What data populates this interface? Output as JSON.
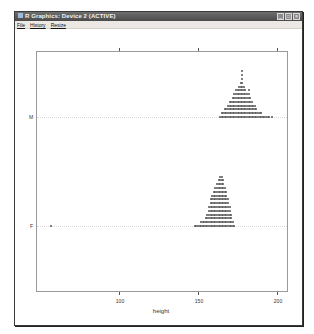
{
  "window": {
    "title": "R Graphics: Device 2 (ACTIVE)",
    "menu": [
      "File",
      "History",
      "Resize"
    ],
    "buttons": {
      "minimize": "_",
      "maximize": "□",
      "close": "×"
    }
  },
  "chart_data": {
    "type": "scatter",
    "subtype": "stripplot (stacked dots)",
    "title": "",
    "xlabel": "height",
    "ylabel": "",
    "categories": [
      "F",
      "M"
    ],
    "x_ticks": [
      100,
      150,
      200
    ],
    "xlim": [
      48,
      206
    ],
    "grid": "dotted horizontal reference lines at each category",
    "series": [
      {
        "name": "M",
        "value_range": [
          164,
          195
        ],
        "outliers": [
          197
        ],
        "counts": {
          "164": 1,
          "165": 2,
          "166": 2,
          "167": 3,
          "168": 3,
          "169": 4,
          "170": 5,
          "171": 5,
          "172": 6,
          "173": 7,
          "174": 8,
          "175": 8,
          "176": 9,
          "177": 10,
          "178": 13,
          "179": 9,
          "180": 8,
          "181": 7,
          "182": 8,
          "183": 6,
          "184": 5,
          "185": 4,
          "186": 4,
          "187": 3,
          "188": 2,
          "189": 2,
          "190": 2,
          "191": 1,
          "192": 1,
          "193": 1,
          "194": 1,
          "195": 1,
          "197": 1
        }
      },
      {
        "name": "F",
        "value_range": [
          148,
          173
        ],
        "outliers": [
          57
        ],
        "counts": {
          "57": 1,
          "148": 1,
          "149": 1,
          "150": 1,
          "151": 1,
          "152": 2,
          "153": 2,
          "154": 2,
          "155": 3,
          "156": 4,
          "157": 6,
          "158": 8,
          "159": 9,
          "160": 10,
          "161": 11,
          "162": 12,
          "163": 13,
          "164": 14,
          "165": 14,
          "166": 13,
          "167": 11,
          "168": 10,
          "169": 8,
          "170": 6,
          "171": 4,
          "172": 2,
          "173": 1
        }
      }
    ]
  },
  "axis": {
    "tick_labels": [
      "100",
      "150",
      "200"
    ],
    "category_labels": [
      "M",
      "F"
    ],
    "x_title": "height"
  },
  "colors": {
    "dots": "#555555",
    "frame": "#9a9a9a",
    "titlebar": "#555555"
  }
}
